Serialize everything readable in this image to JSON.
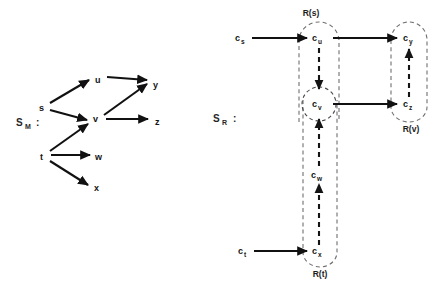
{
  "figure": {
    "background": "#ffffff",
    "ink_color": "#111111",
    "dashed_color": "#6f6f6f"
  },
  "left_panel": {
    "system_label": {
      "base": "S",
      "sub": "M",
      "colon": ":"
    },
    "nodes": [
      {
        "id": "s",
        "label": "s",
        "x": 42,
        "y": 108
      },
      {
        "id": "t",
        "label": "t",
        "x": 43,
        "y": 157
      },
      {
        "id": "u",
        "label": "u",
        "x": 98,
        "y": 80
      },
      {
        "id": "v",
        "label": "v",
        "x": 96,
        "y": 119
      },
      {
        "id": "w",
        "label": "w",
        "x": 99,
        "y": 157
      },
      {
        "id": "x",
        "label": "x",
        "x": 97,
        "y": 188
      },
      {
        "id": "y",
        "label": "y",
        "x": 156,
        "y": 85
      },
      {
        "id": "z",
        "label": "z",
        "x": 158,
        "y": 122
      }
    ],
    "edges": [
      {
        "from": "s",
        "to": "u",
        "style": "solid"
      },
      {
        "from": "s",
        "to": "v",
        "style": "solid"
      },
      {
        "from": "t",
        "to": "v",
        "style": "solid"
      },
      {
        "from": "t",
        "to": "w",
        "style": "solid"
      },
      {
        "from": "t",
        "to": "x",
        "style": "solid"
      },
      {
        "from": "u",
        "to": "y",
        "style": "solid"
      },
      {
        "from": "v",
        "to": "y",
        "style": "solid"
      },
      {
        "from": "v",
        "to": "z",
        "style": "solid"
      }
    ]
  },
  "right_panel": {
    "system_label": {
      "base": "S",
      "sub": "R",
      "colon": ":"
    },
    "regions": [
      {
        "id": "Rs",
        "label": "R(s)",
        "label_x": 311,
        "label_y": 12
      },
      {
        "id": "Rv",
        "label": "R(v)",
        "label_x": 411,
        "label_y": 128
      },
      {
        "id": "Rt",
        "label": "R(t)",
        "label_x": 320,
        "label_y": 274
      }
    ],
    "nodes": [
      {
        "id": "cs",
        "base": "c",
        "sub": "s",
        "x": 240,
        "y": 40,
        "boxed": false
      },
      {
        "id": "cu",
        "base": "c",
        "sub": "u",
        "x": 319,
        "y": 40,
        "boxed": false
      },
      {
        "id": "cy",
        "base": "c",
        "sub": "y",
        "x": 409,
        "y": 40,
        "boxed": false
      },
      {
        "id": "cv",
        "base": "c",
        "sub": "v",
        "x": 319,
        "y": 106,
        "boxed": true
      },
      {
        "id": "cz",
        "base": "c",
        "sub": "z",
        "x": 409,
        "y": 106,
        "boxed": false
      },
      {
        "id": "cw",
        "base": "c",
        "sub": "w",
        "x": 319,
        "y": 175,
        "boxed": false
      },
      {
        "id": "ct",
        "base": "c",
        "sub": "t",
        "x": 243,
        "y": 253,
        "boxed": false
      },
      {
        "id": "cx",
        "base": "c",
        "sub": "x",
        "x": 319,
        "y": 253,
        "boxed": false
      }
    ],
    "edges": [
      {
        "from": "cs",
        "to": "cu",
        "style": "solid",
        "direction": "right"
      },
      {
        "from": "cu",
        "to": "cy",
        "style": "solid",
        "direction": "right"
      },
      {
        "from": "cv",
        "to": "cz",
        "style": "solid",
        "direction": "right"
      },
      {
        "from": "ct",
        "to": "cx",
        "style": "solid",
        "direction": "right"
      },
      {
        "from": "cu",
        "to": "cv",
        "style": "dashed",
        "direction": "down"
      },
      {
        "from": "cw",
        "to": "cv",
        "style": "dashed",
        "direction": "up"
      },
      {
        "from": "cx",
        "to": "cw",
        "style": "dashed",
        "direction": "up"
      },
      {
        "from": "cz",
        "to": "cy",
        "style": "dashed",
        "direction": "up"
      }
    ]
  }
}
